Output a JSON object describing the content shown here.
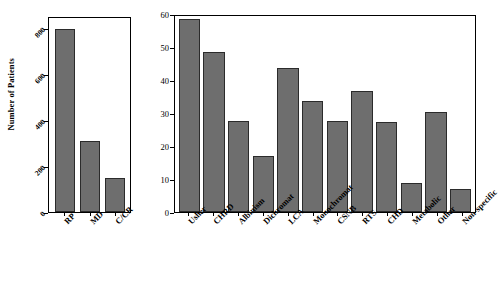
{
  "figure": {
    "background_color": "#ffffff",
    "bar_fill_color": "#6e6e6e",
    "bar_edge_color": "#2b2b2b",
    "axis_color": "#000000"
  },
  "chart_data": [
    {
      "id": "left",
      "type": "bar",
      "title": "",
      "xlabel": "",
      "ylabel": "Number of Patients",
      "categories": [
        "RP",
        "MD",
        "C/CR"
      ],
      "values": [
        800,
        310,
        150
      ],
      "ylim": [
        0,
        850
      ],
      "yticks": [
        0,
        200,
        400,
        600,
        800
      ],
      "ytick_labels": [
        "0",
        "200",
        "400",
        "600",
        "800"
      ],
      "grid": false,
      "legend": "none"
    },
    {
      "id": "right",
      "type": "bar",
      "title": "",
      "xlabel": "",
      "ylabel": "",
      "categories": [
        "Usher",
        "CHRD",
        "Albinism",
        "Dichromat",
        "LCA",
        "Monochromat",
        "CSNB",
        "RTS",
        "CHD",
        "Metabolic",
        "Other",
        "Non-specific"
      ],
      "values": [
        59,
        49,
        28,
        17,
        44,
        34,
        28,
        37,
        27.5,
        9,
        30.5,
        7
      ],
      "ylim": [
        0,
        60
      ],
      "yticks": [
        0,
        10,
        20,
        30,
        40,
        50,
        60
      ],
      "ytick_labels": [
        "0",
        "10",
        "20",
        "30",
        "40",
        "50",
        "60"
      ],
      "grid": false,
      "legend": "none"
    }
  ]
}
